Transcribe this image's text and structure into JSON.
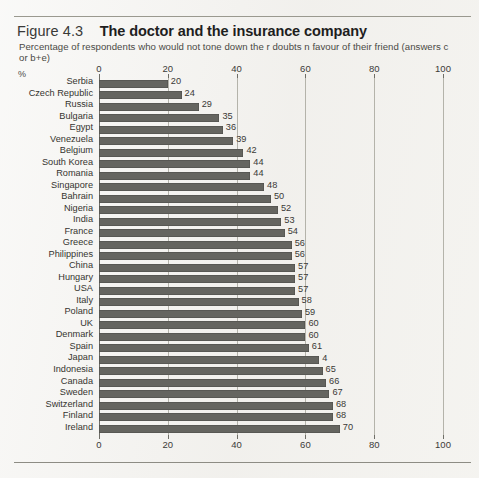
{
  "figure": {
    "number": "Figure 4.3",
    "title": "The doctor and the insurance company",
    "subtitle": "Percentage of respondents who would not tone down the r doubts  n favour of their friend (answers c or b+e)",
    "unit_label": "%"
  },
  "colors": {
    "bar": "#656560",
    "page_background": "#f3f2ef",
    "gridline": "#b4b3aa",
    "axis": "#6f6e67",
    "text": "#35342f"
  },
  "chart_data": {
    "type": "bar",
    "orientation": "horizontal",
    "title": "The doctor and the insurance company",
    "subtitle": "Percentage of respondents who would not tone down the r doubts  n favour of their friend (answers c or b+e)",
    "xlabel": "%",
    "ylabel": "",
    "xlim": [
      0,
      100
    ],
    "grid": true,
    "legend": "none",
    "tick_labels": [
      "0",
      "20",
      "40",
      "60",
      "80",
      "100"
    ],
    "tick_values": [
      0,
      20,
      40,
      60,
      80,
      100
    ],
    "axis_top": true,
    "axis_bottom": true,
    "categories": [
      "Serbia",
      "Czech Republic",
      "Russia",
      "Bulgaria",
      "Egypt",
      "Venezuela",
      "Belgium",
      "South Korea",
      "Romania",
      "Singapore",
      "Bahrain",
      "Nigeria",
      "India",
      "France",
      "Greece",
      "Philippines",
      "China",
      "Hungary",
      "USA",
      "Italy",
      "Poland",
      "UK",
      "Denmark",
      "Spain",
      "Japan",
      "Indonesia",
      "Canada",
      "Sweden",
      "Switzerland",
      "Finland",
      "Ireland"
    ],
    "values": [
      20,
      24,
      29,
      35,
      36,
      39,
      42,
      44,
      44,
      48,
      50,
      52,
      53,
      54,
      56,
      56,
      57,
      57,
      57,
      58,
      59,
      60,
      60,
      61,
      64,
      65,
      66,
      67,
      68,
      68,
      70
    ],
    "data_labels": [
      "20",
      "24",
      "29",
      "35",
      "36",
      "39",
      "42",
      "44",
      "44",
      "48",
      "50",
      "52",
      "53",
      "54",
      "56",
      "56",
      "57",
      "57",
      "57",
      "58",
      "59",
      "60",
      "60",
      "61",
      "4",
      "65",
      "66",
      "67",
      "68",
      "68",
      "70"
    ]
  }
}
